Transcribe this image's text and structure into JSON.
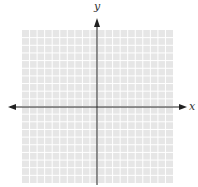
{
  "diagram": {
    "type": "coordinate-plane",
    "x_axis_label": "x",
    "y_axis_label": "y",
    "grid": {
      "columns": 20,
      "rows": 20,
      "fill_color": "#e6e6e6",
      "line_color": "#ffffff"
    },
    "axis_color": "#222222"
  }
}
